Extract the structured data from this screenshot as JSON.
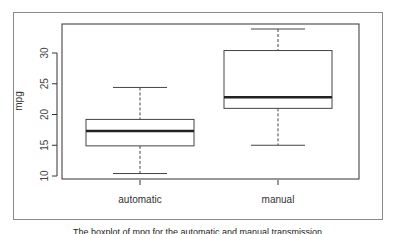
{
  "chart_data": {
    "type": "boxplot",
    "title": "",
    "xlabel": "",
    "ylabel": "mpg",
    "categories": [
      "automatic",
      "manual"
    ],
    "y_ticks": [
      10,
      15,
      20,
      25,
      30
    ],
    "ylim": [
      9.4,
      35
    ],
    "grid": false,
    "legend": null,
    "series": [
      {
        "name": "automatic",
        "lower_whisker": 10.4,
        "q1": 14.9,
        "median": 17.3,
        "q3": 19.2,
        "upper_whisker": 24.4
      },
      {
        "name": "manual",
        "lower_whisker": 15.0,
        "q1": 21.0,
        "median": 22.8,
        "q3": 30.4,
        "upper_whisker": 33.9
      }
    ]
  },
  "caption": "The boxplot of mpg for the automatic and manual transmission"
}
